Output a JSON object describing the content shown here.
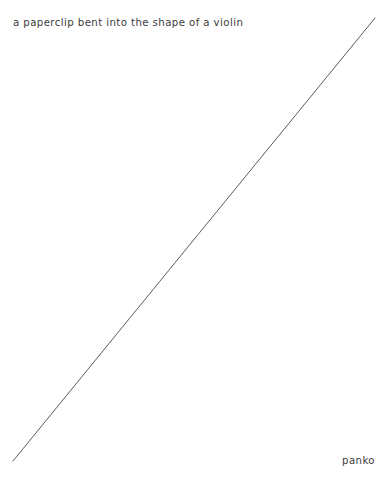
{
  "page": {
    "width": 385,
    "height": 498,
    "background_color": "#ffffff"
  },
  "caption": {
    "text": "a paperclip bent into the shape of a violin",
    "color": "#3c3c3c"
  },
  "signature": {
    "text": "panko",
    "color": "#3c3c3c"
  },
  "artwork": {
    "description": "single-line drawing",
    "stroke_color": "#4a4a4a",
    "stroke_width": 0.9,
    "line": {
      "x1": 13,
      "y1": 461,
      "x2": 375,
      "y2": 18
    }
  }
}
